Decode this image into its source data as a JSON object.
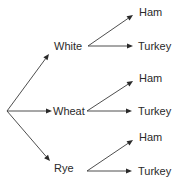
{
  "diagram": {
    "type": "tree",
    "colors": {
      "line": "#3a3a3a",
      "text": "#2a2a2a",
      "background": "#ffffff"
    },
    "root": {
      "x": 7,
      "y": 111
    },
    "breads": [
      {
        "label": "White",
        "arrow_tip": {
          "x": 49,
          "y": 54
        },
        "label_pos": {
          "x": 54,
          "y": 50
        },
        "branch_origin": {
          "x": 88,
          "y": 46
        },
        "fillings": [
          {
            "label": "Ham",
            "tip": {
              "x": 133,
              "y": 15
            },
            "label_pos": {
              "x": 139,
              "y": 16
            }
          },
          {
            "label": "Turkey",
            "tip": {
              "x": 133,
              "y": 46
            },
            "label_pos": {
              "x": 138,
              "y": 50
            }
          }
        ]
      },
      {
        "label": "Wheat",
        "arrow_tip": {
          "x": 52,
          "y": 111
        },
        "label_pos": {
          "x": 53,
          "y": 115
        },
        "branch_origin": {
          "x": 87,
          "y": 111
        },
        "fillings": [
          {
            "label": "Ham",
            "tip": {
              "x": 133,
              "y": 81
            },
            "label_pos": {
              "x": 139,
              "y": 82
            }
          },
          {
            "label": "Turkey",
            "tip": {
              "x": 132,
              "y": 111
            },
            "label_pos": {
              "x": 138,
              "y": 115
            }
          }
        ]
      },
      {
        "label": "Rye",
        "arrow_tip": {
          "x": 50,
          "y": 161
        },
        "label_pos": {
          "x": 54,
          "y": 172
        },
        "branch_origin": {
          "x": 87,
          "y": 171
        },
        "fillings": [
          {
            "label": "Ham",
            "tip": {
              "x": 133,
              "y": 140
            },
            "label_pos": {
              "x": 139,
              "y": 141
            }
          },
          {
            "label": "Turkey",
            "tip": {
              "x": 132,
              "y": 171
            },
            "label_pos": {
              "x": 138,
              "y": 175
            }
          }
        ]
      }
    ]
  }
}
